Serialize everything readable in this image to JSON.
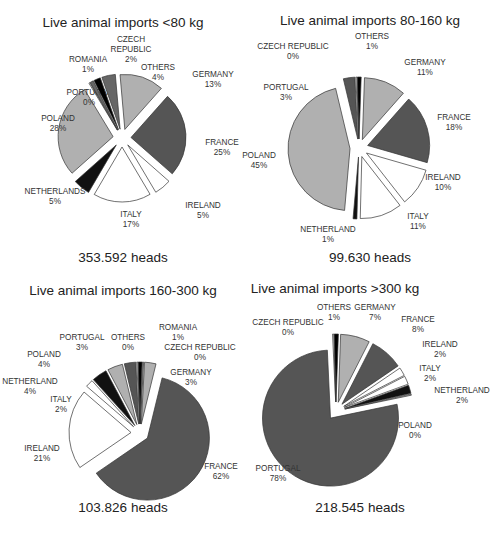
{
  "chart_data": [
    {
      "type": "pie",
      "title": "Live animal imports <80 kg",
      "total_label": "353.592 heads",
      "start_angle_deg": -5,
      "explode": 9,
      "center": [
        122,
        138
      ],
      "radius": 55,
      "slices": [
        {
          "name": "GERMANY",
          "pct": 13,
          "label": "GERMANY\n13%",
          "color": "#b0b0b0",
          "lx": 213,
          "ly": 82,
          "anchor": "middle"
        },
        {
          "name": "FRANCE",
          "pct": 25,
          "label": "FRANCE\n25%",
          "color": "#555555",
          "lx": 222,
          "ly": 150,
          "anchor": "middle"
        },
        {
          "name": "IRELAND",
          "pct": 5,
          "label": "IRELAND\n5%",
          "color": "#ffffff",
          "lx": 203,
          "ly": 213,
          "anchor": "middle"
        },
        {
          "name": "ITALY",
          "pct": 17,
          "label": "ITALY\n17%",
          "color": "#ffffff",
          "lx": 131,
          "ly": 222,
          "anchor": "middle"
        },
        {
          "name": "NETHERLANDS",
          "pct": 5,
          "label": "NETHERLANDS\n5%",
          "color": "#111111",
          "lx": 55,
          "ly": 199,
          "anchor": "middle"
        },
        {
          "name": "POLAND",
          "pct": 28,
          "label": "POLAND\n28%",
          "color": "#b0b0b0",
          "lx": 58,
          "ly": 126,
          "anchor": "middle"
        },
        {
          "name": "PORTUGAL",
          "pct": 0,
          "label": "PORTUGAL\n0%",
          "color": "#ffffff",
          "lx": 89,
          "ly": 100,
          "anchor": "middle"
        },
        {
          "name": "ROMANIA",
          "pct": 1,
          "label": "ROMANIA\n1%",
          "color": "#666666",
          "lx": 88,
          "ly": 67,
          "anchor": "middle"
        },
        {
          "name": "CZECH REPUBLIC",
          "pct": 2,
          "label": "CZECH\nREPUBLIC\n2%",
          "color": "#000000",
          "lx": 131,
          "ly": 52,
          "anchor": "middle"
        },
        {
          "name": "OTHERS",
          "pct": 4,
          "label": "OTHERS\n4%",
          "color": "#666666",
          "lx": 158,
          "ly": 75,
          "anchor": "middle"
        }
      ]
    },
    {
      "type": "pie",
      "title": "Live animal imports 80-160 kg",
      "total_label": "99.630 heads",
      "start_angle_deg": 2,
      "explode": 9,
      "center": [
        359,
        148
      ],
      "radius": 62,
      "slices": [
        {
          "name": "GERMANY",
          "pct": 11,
          "label": "GERMANY\n11%",
          "color": "#b0b0b0",
          "lx": 425,
          "ly": 70,
          "anchor": "middle"
        },
        {
          "name": "FRANCE",
          "pct": 18,
          "label": "FRANCE\n18%",
          "color": "#555555",
          "lx": 454,
          "ly": 125,
          "anchor": "middle"
        },
        {
          "name": "IRELAND",
          "pct": 10,
          "label": "IRELAND\n10%",
          "color": "#ffffff",
          "lx": 443,
          "ly": 185,
          "anchor": "middle"
        },
        {
          "name": "ITALY",
          "pct": 11,
          "label": "ITALY\n11%",
          "color": "#ffffff",
          "lx": 418,
          "ly": 224,
          "anchor": "middle"
        },
        {
          "name": "NETHERLAND",
          "pct": 1,
          "label": "NETHERLAND\n1%",
          "color": "#111111",
          "lx": 328,
          "ly": 237,
          "anchor": "middle"
        },
        {
          "name": "POLAND",
          "pct": 45,
          "label": "POLAND\n45%",
          "color": "#b0b0b0",
          "lx": 259,
          "ly": 163,
          "anchor": "middle"
        },
        {
          "name": "PORTUGAL",
          "pct": 3,
          "label": "PORTUGAL\n3%",
          "color": "#555555",
          "lx": 286,
          "ly": 95,
          "anchor": "middle"
        },
        {
          "name": "CZECH REPUBLIC",
          "pct": 0,
          "label": "CZECH REPUBLIC\n0%",
          "color": "#ffffff",
          "lx": 293,
          "ly": 54,
          "anchor": "middle"
        },
        {
          "name": "OTHERS",
          "pct": 1,
          "label": "OTHERS\n1%",
          "color": "#000000",
          "lx": 372,
          "ly": 44,
          "anchor": "middle"
        }
      ]
    },
    {
      "type": "pie",
      "title": "Live animal imports 160-300 kg",
      "total_label": "103.826 heads",
      "start_angle_deg": 3,
      "explode": 9,
      "center": [
        140,
        433
      ],
      "radius": 62,
      "slices": [
        {
          "name": "GERMANY",
          "pct": 3,
          "label": "GERMANY\n3%",
          "color": "#b0b0b0",
          "lx": 191,
          "ly": 380,
          "anchor": "middle"
        },
        {
          "name": "FRANCE",
          "pct": 62,
          "label": "FRANCE\n62%",
          "color": "#555555",
          "lx": 221,
          "ly": 474,
          "anchor": "middle"
        },
        {
          "name": "IRELAND",
          "pct": 21,
          "label": "IRELAND\n21%",
          "color": "#ffffff",
          "lx": 42,
          "ly": 456,
          "anchor": "middle"
        },
        {
          "name": "ITALY",
          "pct": 2,
          "label": "ITALY\n2%",
          "color": "#ffffff",
          "lx": 61,
          "ly": 407,
          "anchor": "middle"
        },
        {
          "name": "NETHERLAND",
          "pct": 4,
          "label": "NETHERLAND\n4%",
          "color": "#111111",
          "lx": 30,
          "ly": 389,
          "anchor": "middle"
        },
        {
          "name": "POLAND",
          "pct": 4,
          "label": "POLAND\n4%",
          "color": "#b0b0b0",
          "lx": 44,
          "ly": 362,
          "anchor": "middle"
        },
        {
          "name": "PORTUGAL",
          "pct": 3,
          "label": "PORTUGAL\n3%",
          "color": "#555555",
          "lx": 82,
          "ly": 345,
          "anchor": "middle"
        },
        {
          "name": "OTHERS",
          "pct": 0,
          "label": "OTHERS\n0%",
          "color": "#ffffff",
          "lx": 128,
          "ly": 345,
          "anchor": "middle"
        },
        {
          "name": "ROMANIA",
          "pct": 1,
          "label": "ROMANIA\n1%",
          "color": "#000000",
          "lx": 178,
          "ly": 335,
          "anchor": "middle"
        },
        {
          "name": "CZECH REPUBLIC",
          "pct": 0,
          "label": "CZECH REPUBLIC\n0%",
          "color": "#b0b0b0",
          "lx": 200,
          "ly": 355,
          "anchor": "middle"
        }
      ]
    },
    {
      "type": "pie",
      "title": "Live animal imports >300 kg",
      "total_label": "218.545 heads",
      "start_angle_deg": 2,
      "explode": 9,
      "center": [
        336,
        411
      ],
      "radius": 68,
      "slices": [
        {
          "name": "GERMANY",
          "pct": 7,
          "label": "GERMANY\n7%",
          "color": "#b0b0b0",
          "lx": 375,
          "ly": 315,
          "anchor": "middle"
        },
        {
          "name": "FRANCE",
          "pct": 8,
          "label": "FRANCE\n8%",
          "color": "#555555",
          "lx": 418,
          "ly": 327,
          "anchor": "middle"
        },
        {
          "name": "IRELAND",
          "pct": 2,
          "label": "IRELAND\n2%",
          "color": "#ffffff",
          "lx": 440,
          "ly": 352,
          "anchor": "middle"
        },
        {
          "name": "ITALY",
          "pct": 2,
          "label": "ITALY\n2%",
          "color": "#ffffff",
          "lx": 430,
          "ly": 376,
          "anchor": "middle"
        },
        {
          "name": "NETHERLAND",
          "pct": 2,
          "label": "NETHERLAND\n2%",
          "color": "#111111",
          "lx": 462,
          "ly": 398,
          "anchor": "middle"
        },
        {
          "name": "POLAND",
          "pct": 0,
          "label": "POLAND\n0%",
          "color": "#b0b0b0",
          "lx": 415,
          "ly": 433,
          "anchor": "middle"
        },
        {
          "name": "PORTUGAL",
          "pct": 78,
          "label": "PORTUGAL\n78%",
          "color": "#555555",
          "lx": 278,
          "ly": 476,
          "anchor": "middle"
        },
        {
          "name": "CZECH REPUBLIC",
          "pct": 0,
          "label": "CZECH REPUBLIC\n0%",
          "color": "#ffffff",
          "lx": 288,
          "ly": 330,
          "anchor": "middle"
        },
        {
          "name": "OTHERS",
          "pct": 1,
          "label": "OTHERS\n1%",
          "color": "#000000",
          "lx": 334,
          "ly": 315,
          "anchor": "middle"
        }
      ]
    }
  ],
  "panels": [
    {
      "title": "Live animal imports <80 kg",
      "total": "353.592 heads"
    },
    {
      "title": "Live animal imports 80-160 kg",
      "total": "99.630 heads"
    },
    {
      "title": "Live animal imports 160-300 kg",
      "total": "103.826 heads"
    },
    {
      "title": "Live animal imports >300 kg",
      "total": "218.545 heads"
    }
  ]
}
